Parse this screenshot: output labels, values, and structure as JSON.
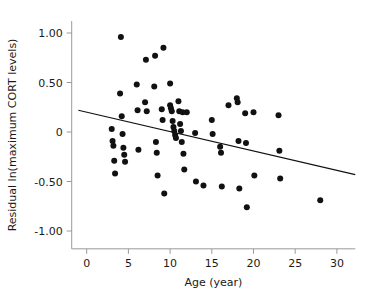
{
  "chart_data": {
    "type": "scatter",
    "title": "",
    "xlabel": "Age (year)",
    "ylabel": "Residual ln(maximum CORT levels)",
    "xlim": [
      -1.8,
      32.2
    ],
    "ylim": [
      -1.18,
      1.12
    ],
    "xticks": [
      0,
      5,
      10,
      15,
      20,
      25,
      30
    ],
    "xtick_labels": [
      "0",
      "5",
      "10",
      "15",
      "20",
      "25",
      "30"
    ],
    "yticks": [
      1.0,
      0.5,
      0,
      -0.5,
      -1.0
    ],
    "ytick_labels": [
      "1.00",
      "0.50",
      "0",
      "-0.50",
      "-1.00"
    ],
    "grid": false,
    "legend": null,
    "marker_color": "#111111",
    "axis_color": "#9a9a9a",
    "background_color": "#ffffff",
    "series": [
      {
        "name": "Residual ln(maximum CORT levels) vs Age",
        "marker": "filled-circle",
        "points": [
          [
            4.1,
            0.96
          ],
          [
            9.2,
            0.85
          ],
          [
            7.1,
            0.73
          ],
          [
            8.2,
            0.77
          ],
          [
            10.0,
            0.49
          ],
          [
            6.0,
            0.48
          ],
          [
            8.1,
            0.46
          ],
          [
            4.0,
            0.39
          ],
          [
            18.0,
            0.34
          ],
          [
            18.1,
            0.3
          ],
          [
            11.0,
            0.31
          ],
          [
            7.0,
            0.3
          ],
          [
            10.0,
            0.27
          ],
          [
            10.1,
            0.24
          ],
          [
            17.0,
            0.27
          ],
          [
            9.0,
            0.23
          ],
          [
            10.2,
            0.21
          ],
          [
            11.1,
            0.21
          ],
          [
            6.1,
            0.22
          ],
          [
            7.2,
            0.21
          ],
          [
            12.0,
            0.2
          ],
          [
            11.5,
            0.2
          ],
          [
            20.0,
            0.2
          ],
          [
            19.0,
            0.19
          ],
          [
            23.0,
            0.17
          ],
          [
            4.2,
            0.16
          ],
          [
            9.1,
            0.12
          ],
          [
            10.3,
            0.11
          ],
          [
            15.0,
            0.12
          ],
          [
            11.2,
            0.08
          ],
          [
            10.4,
            0.05
          ],
          [
            3.0,
            0.03
          ],
          [
            10.5,
            0.01
          ],
          [
            11.3,
            0.01
          ],
          [
            13.0,
            -0.01
          ],
          [
            4.3,
            -0.02
          ],
          [
            10.6,
            -0.03
          ],
          [
            15.1,
            -0.02
          ],
          [
            3.1,
            -0.09
          ],
          [
            8.3,
            -0.1
          ],
          [
            10.7,
            -0.06
          ],
          [
            11.4,
            -0.1
          ],
          [
            18.2,
            -0.09
          ],
          [
            19.1,
            -0.11
          ],
          [
            3.2,
            -0.14
          ],
          [
            4.4,
            -0.16
          ],
          [
            6.2,
            -0.18
          ],
          [
            16.0,
            -0.15
          ],
          [
            23.1,
            -0.19
          ],
          [
            8.4,
            -0.21
          ],
          [
            11.6,
            -0.22
          ],
          [
            4.5,
            -0.23
          ],
          [
            16.1,
            -0.21
          ],
          [
            4.6,
            -0.3
          ],
          [
            3.3,
            -0.29
          ],
          [
            11.7,
            -0.38
          ],
          [
            3.4,
            -0.42
          ],
          [
            8.5,
            -0.44
          ],
          [
            20.1,
            -0.44
          ],
          [
            13.1,
            -0.5
          ],
          [
            23.2,
            -0.47
          ],
          [
            14.0,
            -0.54
          ],
          [
            16.2,
            -0.55
          ],
          [
            18.3,
            -0.57
          ],
          [
            9.3,
            -0.62
          ],
          [
            28.0,
            -0.69
          ],
          [
            19.2,
            -0.76
          ]
        ]
      }
    ],
    "fit_line": {
      "name": "linear regression",
      "x_start": -1.0,
      "y_start": 0.22,
      "x_end": 32.2,
      "y_end": -0.43,
      "color": "#111111"
    }
  }
}
